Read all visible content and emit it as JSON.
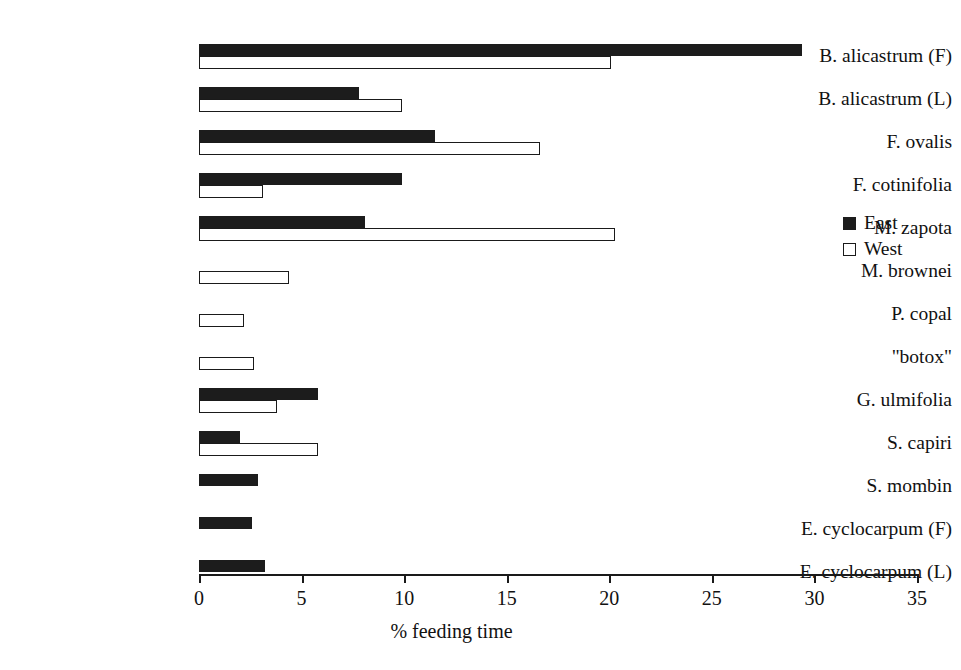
{
  "chart_data": {
    "type": "bar",
    "orientation": "horizontal",
    "title": "",
    "xlabel": "% feeding time",
    "ylabel": "",
    "xlim": [
      0,
      35
    ],
    "xticks": [
      0,
      5,
      10,
      15,
      20,
      25,
      30,
      35
    ],
    "grid": false,
    "legend_position": "right",
    "categories": [
      "B. alicastrum (F)",
      "B. alicastrum (L)",
      "F. ovalis",
      "F. cotinifolia",
      "M. zapota",
      "M. brownei",
      "P. copal",
      "\"botox\"",
      "G. ulmifolia",
      "S. capiri",
      "S. mombin",
      "E. cyclocarpum (F)",
      "E. cyclocarpum (L)"
    ],
    "series": [
      {
        "name": "East",
        "color": "#1c1c1c",
        "values": [
          29.4,
          7.8,
          11.5,
          9.9,
          8.1,
          0,
          0,
          0,
          5.8,
          2.0,
          2.9,
          2.6,
          3.2
        ]
      },
      {
        "name": "West",
        "color": "#ffffff",
        "values": [
          20.1,
          9.9,
          16.6,
          3.1,
          20.3,
          4.4,
          2.2,
          2.7,
          3.8,
          5.8,
          0,
          0,
          0
        ]
      }
    ]
  },
  "legend": {
    "items": [
      {
        "label": "East",
        "swatch": "filled-square-icon"
      },
      {
        "label": "West",
        "swatch": "open-square-icon"
      }
    ]
  },
  "axis": {
    "title": "% feeding time",
    "tick_labels": [
      "0",
      "5",
      "10",
      "15",
      "20",
      "25",
      "30",
      "35"
    ]
  }
}
